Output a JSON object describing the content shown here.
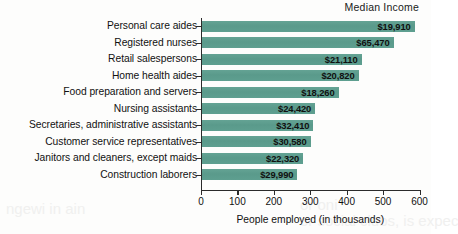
{
  "header": {
    "median_income_label": "Median Income"
  },
  "axis": {
    "x_title": "People employed (in thousands)",
    "x_ticks": [
      "0",
      "100",
      "200",
      "300",
      "400",
      "500",
      "600"
    ]
  },
  "chart_data": {
    "type": "bar",
    "orientation": "horizontal",
    "title": "",
    "xlabel": "People employed (in thousands)",
    "ylabel": "",
    "xlim": [
      0,
      600
    ],
    "grid": false,
    "legend": null,
    "value_label_header": "Median Income",
    "categories": [
      "Personal care aides",
      "Registered nurses",
      "Retail salespersons",
      "Home health aides",
      "Food preparation and servers",
      "Nursing assistants",
      "Secretaries, administrative assistants",
      "Customer service representatives",
      "Janitors and cleaners, except maids",
      "Construction laborers"
    ],
    "values": [
      584,
      526,
      438,
      430,
      375,
      311,
      306,
      298,
      278,
      262
    ],
    "data_labels": [
      "$19,910",
      "$65,470",
      "$21,110",
      "$20,820",
      "$18,260",
      "$24,420",
      "$32,410",
      "$30,580",
      "$22,320",
      "$29,990"
    ],
    "bar_color": "#5d9e8f",
    "axis_color": "#2b2b2b",
    "background": "#fdfdfc"
  }
}
